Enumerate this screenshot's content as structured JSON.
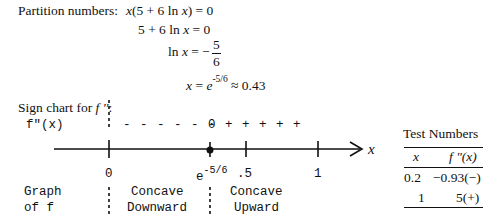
{
  "partition": {
    "label": "Partition numbers:",
    "eq1": {
      "lhs_x": "x",
      "lhs_rest": "(5 + 6 ln ",
      "lhs_x2": "x",
      "rhs": ") = 0"
    },
    "eq2": {
      "text": "5 + 6 ln ",
      "x": "x",
      "rhs": " = 0"
    },
    "eq3": {
      "lhs": "ln ",
      "x": "x",
      "eq": " = −",
      "num": "5",
      "den": "6"
    },
    "eq4": {
      "x": "x",
      "eq": " = ",
      "e": "e",
      "exp": "-5/6",
      "approx": " ≈ 0.43"
    }
  },
  "sign_chart": {
    "title_prefix": "Sign chart for ",
    "title_fn": "f ''",
    "title_suffix": ":",
    "row_label": "f\"(x)",
    "signs_left": "- - - - - -",
    "zero": "0",
    "signs_right": "+ + + + +",
    "axis_label": "x",
    "ticks": [
      {
        "label": "0",
        "base": "0"
      },
      {
        "label": "e-5/6",
        "base": "e",
        "exp": "-5/6"
      },
      {
        "label": ".5",
        "base": ".5"
      },
      {
        "label": "1",
        "base": "1"
      }
    ],
    "graph_label_line1": "Graph",
    "graph_label_line2": "of f",
    "region1_line1": "Concave",
    "region1_line2": "Downward",
    "region2_line1": "Concave",
    "region2_line2": "Upward"
  },
  "test_numbers": {
    "title": "Test Numbers",
    "headers": [
      "x",
      "f \"(x)"
    ],
    "rows": [
      [
        "0.2",
        "−0.93(−)"
      ],
      [
        "1",
        "5(+)"
      ]
    ]
  },
  "colors": {
    "ink": "#111111",
    "background": "#ffffff"
  }
}
